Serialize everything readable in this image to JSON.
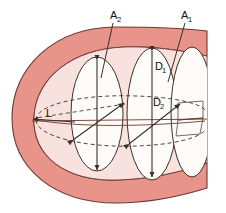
{
  "figure": {
    "background_color": "#ffffff",
    "shell_color": "#e8948a",
    "shell_edge_color": "#6b3a33",
    "interior_color": "#f8e2df",
    "section_fill_color": "#fefcf8",
    "line_color": "#3b3027",
    "dashed_color": "#3b3027"
  },
  "labels": {
    "area_2": {
      "base": "A",
      "sub": "2"
    },
    "area_1": {
      "base": "A",
      "sub": "1"
    },
    "diameter_1": {
      "base": "D",
      "sub": "1"
    },
    "diameter_2": {
      "base": "D",
      "sub": "2"
    },
    "length": {
      "base": "L",
      "sub": ""
    }
  },
  "annotations": [
    {
      "name": "cross-section-area-a2",
      "text": "A2",
      "role": "leader-label"
    },
    {
      "name": "cross-section-area-a1",
      "text": "A1",
      "role": "leader-label"
    },
    {
      "name": "major-diameter-d1",
      "text": "D1",
      "role": "dimension-label"
    },
    {
      "name": "minor-diameter-d2",
      "text": "D2",
      "role": "dimension-label"
    },
    {
      "name": "length-l",
      "text": "L",
      "role": "dimension-label"
    }
  ]
}
